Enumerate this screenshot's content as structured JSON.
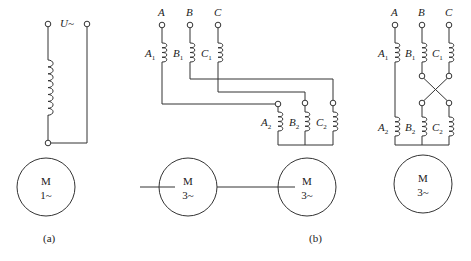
{
  "figure_a": {
    "supply_label": "U~",
    "motor": {
      "line1": "M",
      "line2": "1~"
    },
    "caption": "(a)"
  },
  "figure_b": {
    "phases": [
      "A",
      "B",
      "C"
    ],
    "upper_coils": [
      {
        "name": "A",
        "sub": "1"
      },
      {
        "name": "B",
        "sub": "1"
      },
      {
        "name": "C",
        "sub": "1"
      }
    ],
    "lower_coils": [
      {
        "name": "A",
        "sub": "2"
      },
      {
        "name": "B",
        "sub": "2"
      },
      {
        "name": "C",
        "sub": "2"
      }
    ],
    "motor_left": {
      "line1": "M",
      "line2": "3~"
    },
    "motor_right": {
      "line1": "M",
      "line2": "3~"
    },
    "caption": "(b)"
  },
  "figure_c": {
    "phases": [
      "A",
      "B",
      "C"
    ],
    "upper_coils": [
      {
        "name": "A",
        "sub": "1"
      },
      {
        "name": "B",
        "sub": "1"
      },
      {
        "name": "C",
        "sub": "1"
      }
    ],
    "lower_coils": [
      {
        "name": "A",
        "sub": "2"
      },
      {
        "name": "B",
        "sub": "2"
      },
      {
        "name": "C",
        "sub": "2"
      }
    ],
    "motor": {
      "line1": "M",
      "line2": "3~"
    }
  }
}
